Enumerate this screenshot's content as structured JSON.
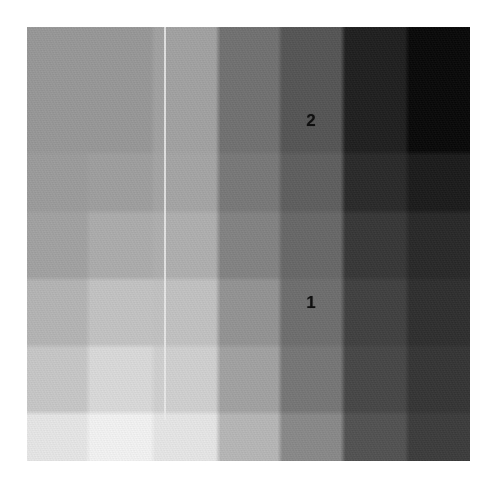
{
  "figure": {
    "type": "heatmap",
    "background_color": "#ffffff",
    "plot_area": {
      "x": 27,
      "y": 27,
      "width": 443,
      "height": 434
    },
    "label_color": "#101010"
  },
  "chart_data": {
    "type": "heatmap",
    "xlabel": "",
    "ylabel": "",
    "grid": false,
    "legend_position": "none",
    "colormap": "grayscale",
    "value_range": [
      10,
      243
    ],
    "n_cols": 7,
    "n_rows": 7,
    "categories": [
      "c1",
      "c2",
      "c3",
      "c4",
      "c5",
      "c6",
      "c7"
    ],
    "row_categories": [
      "r1",
      "r2",
      "r3",
      "r4",
      "r5",
      "r6",
      "r7"
    ],
    "col_edges": [
      27,
      88,
      153,
      218,
      280,
      343,
      407,
      470
    ],
    "row_edges": [
      27,
      88,
      153,
      212,
      279,
      346,
      413,
      461
    ],
    "values": [
      [
        150,
        150,
        150,
        160,
        113,
        86,
        34,
        12
      ],
      [
        150,
        150,
        150,
        160,
        113,
        86,
        34,
        12
      ],
      [
        154,
        154,
        157,
        163,
        120,
        95,
        44,
        30
      ],
      [
        160,
        162,
        170,
        173,
        130,
        104,
        57,
        43
      ],
      [
        178,
        182,
        192,
        191,
        146,
        110,
        66,
        49
      ],
      [
        196,
        203,
        214,
        205,
        160,
        118,
        72,
        55
      ],
      [
        226,
        231,
        238,
        226,
        180,
        136,
        83,
        62
      ]
    ],
    "cell_hex": [
      [
        "#969696",
        "#969696",
        "#a0a0a0",
        "#717171",
        "#565656",
        "#222222",
        "#0c0c0c"
      ],
      [
        "#969696",
        "#969696",
        "#a0a0a0",
        "#717171",
        "#565656",
        "#222222",
        "#0c0c0c"
      ],
      [
        "#9a9a9a",
        "#9d9d9d",
        "#a3a3a3",
        "#787878",
        "#5f5f5f",
        "#2c2c2c",
        "#1e1e1e"
      ],
      [
        "#a0a0a0",
        "#aaaaaa",
        "#adadad",
        "#828282",
        "#686868",
        "#393939",
        "#2b2b2b"
      ],
      [
        "#b2b2b2",
        "#c0c0c0",
        "#bfbfbf",
        "#929292",
        "#6e6e6e",
        "#424242",
        "#313131"
      ],
      [
        "#c4c4c4",
        "#d6d6d6",
        "#cdcdcd",
        "#a0a0a0",
        "#767676",
        "#484848",
        "#373737"
      ],
      [
        "#e2e2e2",
        "#eeeeee",
        "#e2e2e2",
        "#b4b4b4",
        "#888888",
        "#535353",
        "#3e3e3e"
      ]
    ],
    "stripe": {
      "description": "thin bright vertical line inside column 3",
      "x": 164,
      "width": 2,
      "color": "#e8e8e8",
      "y_start": 27,
      "y_end": 420
    },
    "annotations": [
      {
        "text": "2",
        "x": 311,
        "y": 120,
        "font_size": 17,
        "color": "#101010",
        "cell_col": 4,
        "cell_row": 1
      },
      {
        "text": "1",
        "x": 311,
        "y": 302,
        "font_size": 17,
        "color": "#101010",
        "cell_col": 4,
        "cell_row": 4
      }
    ]
  }
}
